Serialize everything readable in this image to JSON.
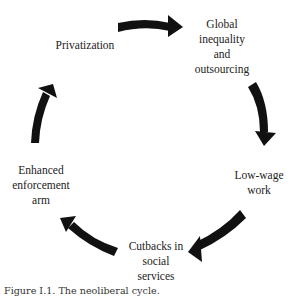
{
  "diagram": {
    "type": "cycle",
    "nodes": [
      {
        "id": "privatization",
        "label": "Privatization"
      },
      {
        "id": "global",
        "label": "Global\ninequality\nand\noutsourcing"
      },
      {
        "id": "lowwage",
        "label": "Low-wage\nwork"
      },
      {
        "id": "cutbacks",
        "label": "Cutbacks in\nsocial\nservices"
      },
      {
        "id": "enforcement",
        "label": "Enhanced\nenforcement\narm"
      }
    ],
    "edges": [
      {
        "from": "privatization",
        "to": "global"
      },
      {
        "from": "global",
        "to": "lowwage"
      },
      {
        "from": "lowwage",
        "to": "cutbacks"
      },
      {
        "from": "cutbacks",
        "to": "enforcement"
      },
      {
        "from": "enforcement",
        "to": "privatization"
      }
    ],
    "arrow_color": "#111111"
  },
  "caption": "Figure I.1. The neoliberal cycle."
}
